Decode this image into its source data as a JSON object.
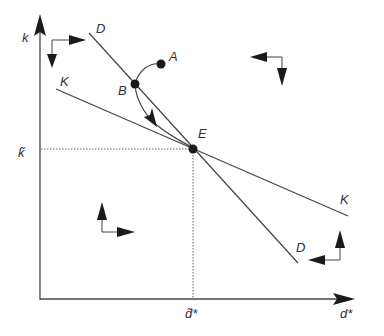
{
  "diagram": {
    "axes": {
      "y_label": "k",
      "x_label": "d*",
      "y_tick_label": "k̃",
      "x_tick_label": "d̃*"
    },
    "curves": {
      "D": {
        "label_top": "D",
        "label_bottom": "D"
      },
      "K": {
        "label_left": "K",
        "label_right": "K"
      }
    },
    "points": {
      "A": "A",
      "B": "B",
      "E": "E"
    },
    "colors": {
      "line": "#444444",
      "arrow": "#1a1a1a",
      "dotted": "#666666"
    }
  }
}
